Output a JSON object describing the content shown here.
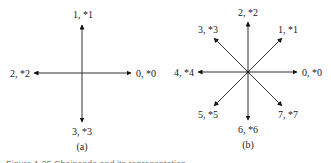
{
  "figure": {
    "caption": "Figure 1.25  Chaincode and its representation",
    "panel_a": {
      "label": "(a)",
      "directions": [
        {
          "code": "0, *0",
          "dir": "right"
        },
        {
          "code": "1, *1",
          "dir": "up"
        },
        {
          "code": "2, *2",
          "dir": "left"
        },
        {
          "code": "3, *3",
          "dir": "down"
        }
      ]
    },
    "panel_b": {
      "label": "(b)",
      "directions": [
        {
          "code": "0, *0",
          "dir": "right"
        },
        {
          "code": "1, *1",
          "dir": "up-right"
        },
        {
          "code": "2, *2",
          "dir": "up"
        },
        {
          "code": "3, *3",
          "dir": "up-left"
        },
        {
          "code": "4, *4",
          "dir": "left"
        },
        {
          "code": "5, *5",
          "dir": "down-left"
        },
        {
          "code": "6, *6",
          "dir": "down"
        },
        {
          "code": "7, *7",
          "dir": "down-right"
        }
      ]
    }
  }
}
